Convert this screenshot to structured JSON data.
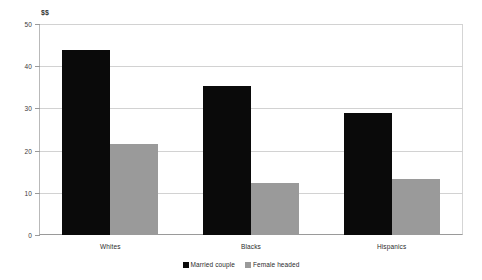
{
  "chart_data": {
    "type": "bar",
    "title": "",
    "subtitle": "",
    "unit_label": "$$",
    "xlabel": "",
    "ylabel": "",
    "categories": [
      "Whites",
      "Blacks",
      "Hispanics"
    ],
    "series": [
      {
        "name": "Married couple",
        "color": "#0a0a0a",
        "values": [
          43.8,
          35.4,
          28.9
        ]
      },
      {
        "name": "Female headed",
        "color": "#9a9a9a",
        "values": [
          21.6,
          12.4,
          13.3
        ]
      }
    ],
    "ylim": [
      0,
      50
    ],
    "yticks": [
      0,
      10,
      20,
      30,
      40,
      50
    ],
    "ytick_labels": [
      "0",
      "10",
      "20",
      "30",
      "40",
      "50"
    ],
    "grid": true,
    "grid_axis": "y",
    "legend_position": "bottom-center",
    "background_color": "#ffffff",
    "gridline_color": "#d2d2d2",
    "axis_color": "#9a9a9a"
  },
  "legend": {
    "items": [
      {
        "label": "Married couple",
        "swatch": "legend-swatch-married"
      },
      {
        "label": "Female headed",
        "swatch": "legend-swatch-female"
      }
    ]
  }
}
